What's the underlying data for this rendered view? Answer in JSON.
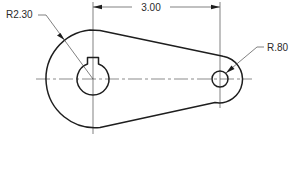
{
  "drawing": {
    "type": "orthographic-part-view",
    "line_color": "#1e1e1e",
    "background": "#ffffff",
    "dimensions": {
      "center_distance": {
        "label": "3.00"
      },
      "large_radius": {
        "label": "R2.30"
      },
      "small_radius": {
        "label": "R.80"
      }
    },
    "features": [
      {
        "name": "large-boss",
        "description": "large arc end",
        "radius_label": "R2.30"
      },
      {
        "name": "keyed-bore",
        "description": "center hole with keyway"
      },
      {
        "name": "small-boss",
        "description": "small arc end",
        "radius_label": "R.80"
      },
      {
        "name": "small-hole",
        "description": "small through hole"
      }
    ]
  }
}
